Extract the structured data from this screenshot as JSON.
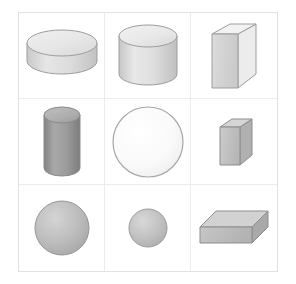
{
  "canvas": {
    "width": 296,
    "height": 284,
    "background": "#ffffff"
  },
  "grid": {
    "rows": 3,
    "columns": 3,
    "border_color": "#e2e2e2",
    "line_color": "#ececec",
    "left": 18,
    "top": 12,
    "width": 260,
    "height": 260
  },
  "palette": {
    "outline": "#9a9a9a",
    "light_fill": "#e4e4e4",
    "light_top": "#ededed",
    "mid_fill": "#c9c9c9",
    "dark_fill": "#9d9d9d",
    "near_white": "#f7f7f7",
    "shadow": "#b4b4b4"
  },
  "cells": [
    {
      "index": 1,
      "row": 1,
      "column": 1,
      "shape": "cylinder",
      "label": "flat-disc-cylinder",
      "description": "short wide light gray cylinder (disc) seen from above",
      "size": "large-diameter",
      "tone": "light",
      "fill": "#e0e0e0",
      "top_fill": "#e9e9e9"
    },
    {
      "index": 2,
      "row": 1,
      "column": 2,
      "shape": "cylinder",
      "label": "upright-cylinder",
      "description": "medium height light gray cylinder standing upright",
      "size": "medium",
      "tone": "light",
      "fill": "#e0e0e0",
      "top_fill": "#ededed"
    },
    {
      "index": 3,
      "row": 1,
      "column": 3,
      "shape": "cuboid",
      "label": "tall-thin-box",
      "description": "tall narrow light gray rectangular box standing on end",
      "size": "tall",
      "tone": "light",
      "fill": "#e3e3e3",
      "top_fill": "#efefef",
      "side_fill": "#cfcfcf"
    },
    {
      "index": 4,
      "row": 2,
      "column": 1,
      "shape": "cylinder",
      "label": "tall-narrow-cylinder",
      "description": "tall narrow medium-dark gray cylinder",
      "size": "tall-narrow",
      "tone": "dark",
      "fill": "#a0a0a0",
      "top_fill": "#b0b0b0"
    },
    {
      "index": 5,
      "row": 2,
      "column": 2,
      "shape": "sphere",
      "label": "large-pale-sphere",
      "description": "large nearly white sphere with thin gray outline",
      "size": "large",
      "tone": "near-white",
      "fill": "#fafafa"
    },
    {
      "index": 6,
      "row": 2,
      "column": 3,
      "shape": "cuboid",
      "label": "small-upright-box",
      "description": "small upright medium gray rectangular box",
      "size": "small-tall",
      "tone": "medium",
      "fill": "#c4c4c4",
      "top_fill": "#d4d4d4",
      "side_fill": "#aeaeae"
    },
    {
      "index": 7,
      "row": 3,
      "column": 1,
      "shape": "sphere",
      "label": "large-gray-sphere",
      "description": "large medium gray sphere",
      "size": "large",
      "tone": "medium",
      "fill": "#b8b8b8"
    },
    {
      "index": 8,
      "row": 3,
      "column": 2,
      "shape": "sphere",
      "label": "small-gray-sphere",
      "description": "small medium gray sphere",
      "size": "small",
      "tone": "medium",
      "fill": "#bdbdbd"
    },
    {
      "index": 9,
      "row": 3,
      "column": 3,
      "shape": "cuboid",
      "label": "wide-flat-box",
      "description": "wide flat medium gray rectangular box lying down",
      "size": "wide-flat",
      "tone": "medium",
      "fill": "#c0c0c0",
      "top_fill": "#cdcdcd",
      "side_fill": "#a8a8a8"
    }
  ]
}
